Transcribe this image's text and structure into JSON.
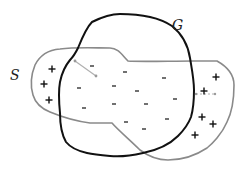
{
  "diagram": {
    "labels": {
      "S": "S",
      "G": "G"
    },
    "colors": {
      "G_boundary": "#111111",
      "S_boundary": "#8a8a8a",
      "arrow": "#b0b0b0",
      "signs": "#111111"
    },
    "regions": [
      {
        "name": "G",
        "description": "black closed curve"
      },
      {
        "name": "S",
        "description": "gray closed curve"
      }
    ],
    "plus_signs": [
      {
        "x": 52,
        "y": 69
      },
      {
        "x": 44,
        "y": 84
      },
      {
        "x": 49,
        "y": 100
      },
      {
        "x": 216,
        "y": 77
      },
      {
        "x": 204,
        "y": 91
      },
      {
        "x": 202,
        "y": 117
      },
      {
        "x": 213,
        "y": 124
      },
      {
        "x": 195,
        "y": 135
      }
    ],
    "minus_signs": [
      {
        "x": 92,
        "y": 66
      },
      {
        "x": 125,
        "y": 72
      },
      {
        "x": 164,
        "y": 78
      },
      {
        "x": 114,
        "y": 86
      },
      {
        "x": 79,
        "y": 88
      },
      {
        "x": 137,
        "y": 91
      },
      {
        "x": 175,
        "y": 99
      },
      {
        "x": 114,
        "y": 104
      },
      {
        "x": 146,
        "y": 104
      },
      {
        "x": 84,
        "y": 108
      },
      {
        "x": 167,
        "y": 119
      },
      {
        "x": 126,
        "y": 122
      },
      {
        "x": 144,
        "y": 129
      }
    ],
    "sign_glyphs": {
      "plus": "+",
      "minus": "-"
    }
  }
}
